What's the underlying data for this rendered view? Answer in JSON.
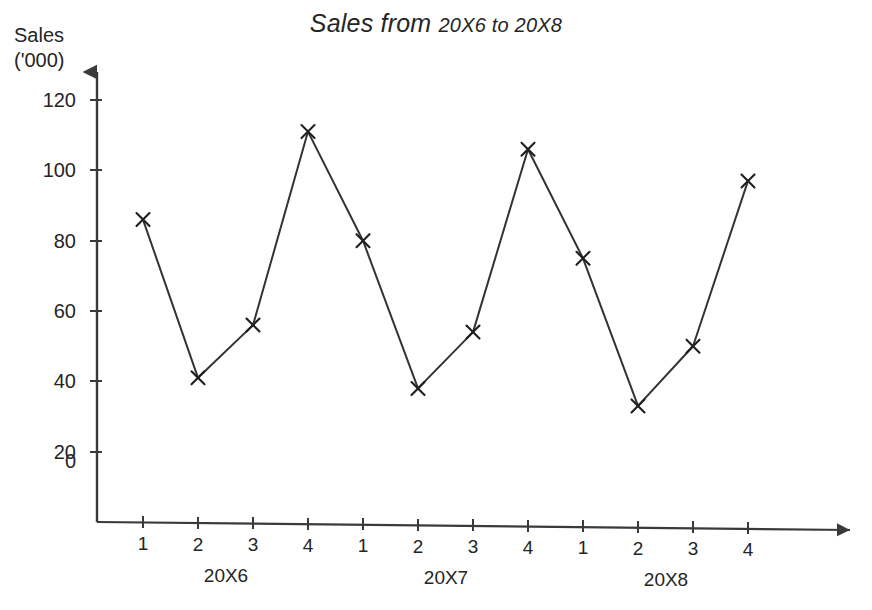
{
  "title": {
    "main": "Sales from",
    "range": "20X6 to 20X8",
    "full": "Sales from 20X6 to 20X8"
  },
  "axis": {
    "y_label_line1": "Sales",
    "y_label_line2": "('000)",
    "y_ticks": [
      "0",
      "20",
      "40",
      "60",
      "80",
      "100",
      "120"
    ],
    "x_tick_labels": [
      "1",
      "2",
      "3",
      "4",
      "1",
      "2",
      "3",
      "4",
      "1",
      "2",
      "3",
      "4"
    ],
    "x_group_labels": [
      "20X6",
      "20X7",
      "20X8"
    ]
  },
  "colors": {
    "line": "#333333",
    "axis": "#3a3a3a",
    "text": "#252525",
    "background": "#ffffff"
  },
  "chart_data": {
    "type": "line",
    "title": "Sales from 20X6 to 20X8",
    "xlabel": "",
    "ylabel": "Sales ('000)",
    "ylim": [
      0,
      130
    ],
    "grid": false,
    "legend": "none",
    "marker": "x",
    "categories": [
      "20X6 Q1",
      "20X6 Q2",
      "20X6 Q3",
      "20X6 Q4",
      "20X7 Q1",
      "20X7 Q2",
      "20X7 Q3",
      "20X7 Q4",
      "20X8 Q1",
      "20X8 Q2",
      "20X8 Q3",
      "20X8 Q4"
    ],
    "x": [
      1,
      2,
      3,
      4,
      1,
      2,
      3,
      4,
      1,
      2,
      3,
      4
    ],
    "groups": [
      "20X6",
      "20X6",
      "20X6",
      "20X6",
      "20X7",
      "20X7",
      "20X7",
      "20X7",
      "20X8",
      "20X8",
      "20X8",
      "20X8"
    ],
    "values": [
      86,
      41,
      56,
      111,
      80,
      38,
      54,
      106,
      75,
      33,
      50,
      97
    ],
    "yticks": [
      0,
      20,
      40,
      60,
      80,
      100,
      120
    ]
  }
}
